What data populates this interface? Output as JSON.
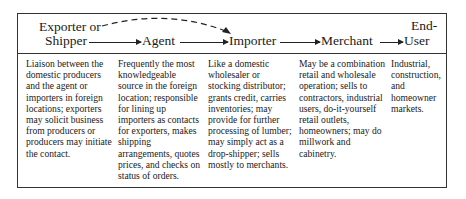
{
  "header": {
    "exporter_line1": "Exporter or",
    "exporter_line2": "Shipper",
    "agent": "Agent",
    "importer": "Importer",
    "merchant": "Merchant",
    "enduser_line1": "End-",
    "enduser_line2": "User"
  },
  "columns": [
    {
      "role": "Exporter or Shipper",
      "text": "Liaison between the domestic producers and the agent or importers in foreign locations; exporters may solicit business from producers or producers may initiate the contact."
    },
    {
      "role": "Agent",
      "text": "Frequently the most knowledgeable source in the foreign location; responsible for lining up importers as contacts for exporters, makes shipping arrangements, quotes prices, and checks on status of orders."
    },
    {
      "role": "Importer",
      "text": "Like a domestic wholesaler or stocking distributor; grants credit, carries inventories; may provide for further processing of lumber; may simply act as a drop-shipper; sells mostly to merchants."
    },
    {
      "role": "Merchant",
      "text": "May be a combination retail and wholesale operation; sells to contractors, industrial users, do-it-yourself retail outlets, homeowners; may do millwork and cabinetry."
    },
    {
      "role": "End-User",
      "text": "Industrial, construction, and homeowner markets."
    }
  ]
}
